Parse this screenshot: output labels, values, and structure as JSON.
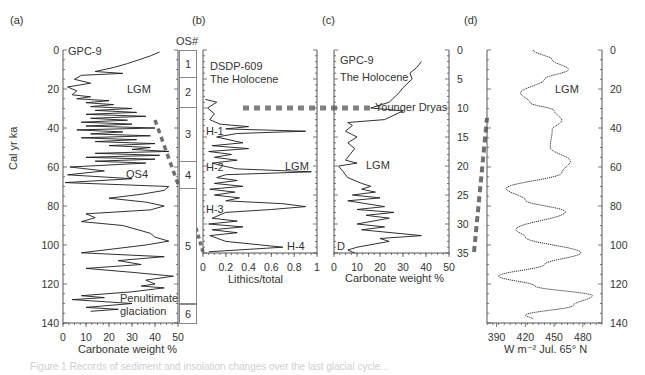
{
  "figure": {
    "panels": {
      "a": {
        "letter": "(a)",
        "core": "GPC-9",
        "ylabel": "Cal yr ka",
        "xlabel": "Carbonate weight %",
        "annotations": [
          "LGM",
          "OS4",
          "Penultimate",
          "glaciation"
        ]
      },
      "b": {
        "letter": "(b)",
        "os_header": "OS#",
        "core": "DSDP-609",
        "subtitle": "The Holocene",
        "xlabel": "Lithics/total",
        "annotations": [
          "H-1",
          "H-2",
          "LGM",
          "H-3",
          "H-4"
        ]
      },
      "c": {
        "letter": "(c)",
        "core": "GPC-9",
        "subtitle": "The Holocene",
        "xlabel": "Carbonate weight %",
        "annotations": [
          "Younger Dryas",
          "LGM",
          "D"
        ]
      },
      "d": {
        "letter": "(d)",
        "xlabel": "W m⁻² Jul. 65° N",
        "annotations": [
          "LGM"
        ]
      }
    },
    "os_stages": [
      {
        "label": "1",
        "from": 0,
        "to": 14
      },
      {
        "label": "2",
        "from": 14,
        "to": 29
      },
      {
        "label": "3",
        "from": 29,
        "to": 57
      },
      {
        "label": "4",
        "from": 57,
        "to": 71
      },
      {
        "label": "5",
        "from": 71,
        "to": 130
      },
      {
        "label": "6",
        "from": 130,
        "to": 140
      }
    ],
    "caption": "Figure 1  Records of sediment and insolation changes over the last glacial cycle..."
  },
  "chart_data": [
    {
      "panel": "a",
      "type": "line",
      "title": "GPC-9",
      "xlabel": "Carbonate weight %",
      "ylabel": "Cal yr ka",
      "xlim": [
        0,
        50
      ],
      "ylim": [
        140,
        0
      ],
      "xticks": [
        0,
        10,
        20,
        30,
        40,
        50
      ],
      "yticks": [
        0,
        20,
        40,
        60,
        80,
        100,
        120,
        140
      ],
      "x": [
        42,
        38,
        33,
        28,
        22,
        14,
        26,
        8,
        5,
        12,
        2,
        6,
        4,
        12,
        6,
        20,
        10,
        22,
        12,
        30,
        14,
        32,
        10,
        36,
        12,
        28,
        8,
        30,
        10,
        40,
        6,
        26,
        12,
        38,
        8,
        32,
        14,
        40,
        20,
        38,
        30,
        46,
        14,
        42,
        10,
        40,
        14,
        36,
        3,
        18,
        2,
        30,
        1,
        46,
        44,
        34,
        20,
        36,
        44,
        38,
        10,
        14,
        8,
        26,
        38,
        40,
        46,
        36,
        8,
        44,
        24,
        34,
        10,
        30,
        48,
        36,
        40,
        34,
        44,
        30,
        8,
        18,
        4,
        30,
        10,
        24,
        12
      ],
      "y": [
        1,
        3,
        5,
        7,
        9,
        11,
        12,
        13,
        15,
        17,
        19,
        21,
        23,
        24,
        25,
        26,
        27,
        28,
        29,
        30,
        31,
        32,
        33,
        34,
        35,
        36,
        37,
        38,
        39,
        40,
        41,
        42,
        43,
        44,
        45,
        46,
        47,
        48,
        49,
        50,
        51,
        52,
        53,
        54,
        55,
        56,
        57,
        58,
        60,
        62,
        64,
        66,
        68,
        70,
        72,
        74,
        76,
        78,
        80,
        82,
        84,
        86,
        88,
        90,
        94,
        96,
        98,
        100,
        104,
        106,
        108,
        110,
        112,
        114,
        116,
        118,
        120,
        121,
        122,
        124,
        126,
        127,
        128,
        130,
        132,
        133,
        134
      ],
      "annotations": [
        "GPC-9",
        "LGM",
        "OS4",
        "Penultimate glaciation"
      ]
    },
    {
      "panel": "b",
      "type": "line",
      "title": "DSDP-609",
      "xlabel": "Lithics/total",
      "xlim": [
        0,
        1
      ],
      "ylim": [
        35,
        0
      ],
      "xticks": [
        0,
        0.2,
        0.4,
        0.6,
        0.8,
        1
      ],
      "x": [
        0.02,
        0.12,
        0.04,
        0.1,
        0.08,
        0.06,
        0.15,
        0.4,
        0.2,
        0.9,
        0.3,
        0.12,
        0.35,
        0.08,
        0.4,
        0.05,
        0.25,
        0.1,
        0.3,
        0.08,
        0.18,
        0.3,
        0.95,
        0.2,
        0.12,
        0.3,
        0.1,
        0.35,
        0.06,
        0.28,
        0.1,
        0.32,
        0.2,
        0.7,
        0.9,
        0.6,
        0.2,
        0.08,
        0.3,
        0.05,
        0.35,
        0.08,
        0.3,
        0.06,
        0.2,
        0.7,
        0.05
      ],
      "y": [
        8.5,
        9,
        10,
        11,
        11.5,
        12,
        12.8,
        13.2,
        13.6,
        14,
        14.4,
        15,
        16,
        16.5,
        17,
        17.5,
        18,
        18.5,
        19,
        19.5,
        20,
        20.5,
        21,
        21.5,
        22,
        22.5,
        23,
        23.5,
        24,
        24.5,
        25,
        25.5,
        26,
        26.5,
        27,
        27.5,
        28,
        29,
        29.5,
        30,
        30.5,
        31,
        31.5,
        32,
        33,
        34,
        34.8
      ],
      "annotations": [
        "The Holocene",
        "H-1",
        "H-2",
        "LGM",
        "H-3",
        "H-4"
      ]
    },
    {
      "panel": "c",
      "type": "line",
      "title": "GPC-9",
      "xlabel": "Carbonate weight %",
      "xlim": [
        0,
        50
      ],
      "ylim": [
        35,
        0
      ],
      "xticks": [
        0,
        10,
        20,
        30,
        40,
        50
      ],
      "yticks": [
        0,
        5,
        10,
        15,
        20,
        25,
        30,
        35
      ],
      "x": [
        38,
        36,
        33,
        34,
        30,
        28,
        24,
        16,
        30,
        22,
        6,
        8,
        5,
        10,
        6,
        9,
        7,
        5,
        10,
        2,
        4,
        6,
        12,
        16,
        12,
        18,
        8,
        20,
        6,
        22,
        10,
        26,
        14,
        24,
        10,
        22,
        12,
        38,
        20,
        24,
        10,
        6,
        9
      ],
      "y": [
        2,
        3,
        4,
        5,
        6.5,
        7.5,
        9,
        10,
        10.5,
        12,
        12.5,
        13,
        14,
        15,
        16,
        17,
        18,
        19,
        19.5,
        20,
        21,
        22,
        23,
        23.5,
        24,
        24.5,
        25,
        25.5,
        26,
        27,
        27.5,
        28,
        28.5,
        29,
        30,
        30.5,
        31,
        32,
        32.5,
        33,
        34,
        34.5,
        35
      ],
      "annotations": [
        "The Holocene",
        "Younger Dryas",
        "LGM",
        "D"
      ]
    },
    {
      "panel": "d",
      "type": "line",
      "title": "July insolation 65° N",
      "xlabel": "W m⁻² Jul. 65° N",
      "xlim": [
        380,
        500
      ],
      "ylim": [
        140,
        0
      ],
      "xticks": [
        390,
        420,
        450,
        480
      ],
      "yticks": [
        0,
        20,
        40,
        60,
        80,
        100,
        120,
        140
      ],
      "x": [
        428,
        448,
        465,
        440,
        415,
        425,
        450,
        458,
        448,
        446,
        467,
        458,
        400,
        420,
        462,
        410,
        420,
        478,
        440,
        392,
        430,
        490,
        470,
        420,
        428
      ],
      "y": [
        0,
        5,
        10,
        15,
        22,
        27,
        31,
        36,
        41,
        50,
        57,
        63,
        71,
        77,
        83,
        92,
        96,
        104,
        110,
        116,
        121,
        126,
        131,
        136,
        138
      ],
      "annotations": [
        "LGM"
      ]
    }
  ],
  "connectors": {
    "younger_dryas_line": {
      "from_panel": "b",
      "to_panel": "c",
      "age_ka": 10,
      "style": "dashed"
    }
  }
}
